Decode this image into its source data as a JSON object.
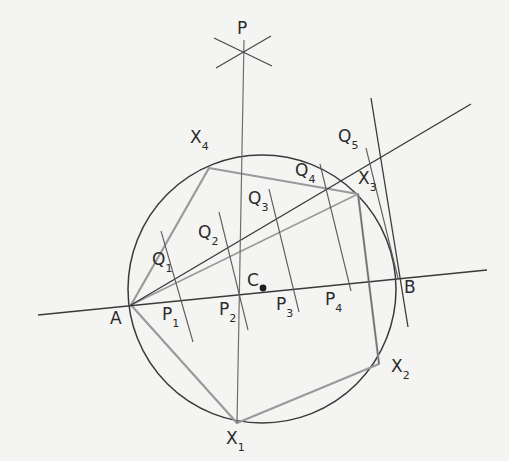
{
  "figure": {
    "background_color": "#f4f4f2",
    "ink_color": "#3a3a3a",
    "accent_color": "#8c8c8c",
    "width": 509,
    "height": 461
  },
  "circle": {
    "center_x": 262,
    "center_y": 289,
    "radius": 134,
    "stroke": "#3a3a3a"
  },
  "center_dot": {
    "x": 263,
    "y": 288,
    "label": "C"
  },
  "points": {
    "P": {
      "label": "P",
      "sub": "",
      "x": 242,
      "y": 49,
      "label_x": 237,
      "label_y": 20
    },
    "A": {
      "label": "A",
      "sub": "",
      "x": 131,
      "y": 305,
      "label_x": 110,
      "label_y": 310
    },
    "B": {
      "label": "B",
      "sub": "",
      "x": 397,
      "y": 278,
      "label_x": 404,
      "label_y": 279
    },
    "C": {
      "label": "C",
      "sub": "",
      "x": 263,
      "y": 288,
      "label_x": 247,
      "label_y": 272
    },
    "X1": {
      "label": "X",
      "sub": "1",
      "x": 237,
      "y": 423,
      "label_x": 226,
      "label_y": 430
    },
    "X2": {
      "label": "X",
      "sub": "2",
      "x": 379,
      "y": 364,
      "label_x": 391,
      "label_y": 358
    },
    "X3": {
      "label": "X",
      "sub": "3",
      "x": 358,
      "y": 194,
      "label_x": 358,
      "label_y": 170
    },
    "X4": {
      "label": "X",
      "sub": "4",
      "x": 209,
      "y": 168,
      "label_x": 190,
      "label_y": 129
    },
    "P1": {
      "label": "P",
      "sub": "1",
      "x": 180,
      "y": 302,
      "label_x": 162,
      "label_y": 306
    },
    "P2": {
      "label": "P",
      "sub": "2",
      "x": 238,
      "y": 296,
      "label_x": 219,
      "label_y": 301
    },
    "P3": {
      "label": "P",
      "sub": "3",
      "x": 292,
      "y": 290,
      "label_x": 276,
      "label_y": 296
    },
    "P4": {
      "label": "P",
      "sub": "4",
      "x": 341,
      "y": 285,
      "label_x": 325,
      "label_y": 291
    },
    "Q1": {
      "label": "Q",
      "sub": "1",
      "x": 180,
      "y": 258,
      "label_x": 152,
      "label_y": 251
    },
    "Q2": {
      "label": "Q",
      "sub": "2",
      "x": 226,
      "y": 235,
      "label_x": 198,
      "label_y": 224
    },
    "Q3": {
      "label": "Q",
      "sub": "3",
      "x": 276,
      "y": 214,
      "label_x": 248,
      "label_y": 190
    },
    "Q4": {
      "label": "Q",
      "sub": "4",
      "x": 330,
      "y": 186,
      "label_x": 295,
      "label_y": 162
    },
    "Q5": {
      "label": "Q",
      "sub": "5",
      "x": 372,
      "y": 158,
      "label_x": 338,
      "label_y": 128
    }
  },
  "polygon": {
    "name": "inscribed-polygon",
    "stroke": "#9a9a9a",
    "vertices": [
      "A",
      "X4",
      "X3",
      "X2",
      "X1"
    ],
    "path": "M131,305 L209,168 L358,194 L379,364 L237,423 Z"
  },
  "lines": {
    "chord_AB": {
      "name": "line-AB",
      "x1": 38,
      "y1": 315,
      "x2": 487,
      "y2": 270
    },
    "ray_A_Q5": {
      "name": "ray-A-to-Q5",
      "x1": 131,
      "y1": 305,
      "x2": 471,
      "y2": 104
    },
    "vertical_P": {
      "name": "line-P-X1",
      "x1": 244,
      "y1": 40,
      "x2": 237,
      "y2": 423
    },
    "tangent_B": {
      "name": "tangent-at-B",
      "x1": 371,
      "y1": 98,
      "x2": 408,
      "y2": 327
    },
    "perp_1": {
      "name": "perpendicular-P1-Q1",
      "x1": 161,
      "y1": 231,
      "x2": 193,
      "y2": 342
    },
    "perp_2": {
      "name": "perpendicular-P2-Q2",
      "x1": 219,
      "y1": 212,
      "x2": 248,
      "y2": 330
    },
    "perp_3": {
      "name": "perpendicular-P3-Q3",
      "x1": 269,
      "y1": 189,
      "x2": 299,
      "y2": 312
    },
    "perp_4": {
      "name": "perpendicular-P4-Q4",
      "x1": 320,
      "y1": 164,
      "x2": 351,
      "y2": 291
    },
    "perp_5": {
      "name": "perpendicular-B-Q5",
      "x1": 366,
      "y1": 148,
      "x2": 398,
      "y2": 278
    },
    "seg_X3_X2": {
      "name": "segment-X3-X2",
      "x1": 358,
      "y1": 194,
      "x2": 379,
      "y2": 364
    }
  },
  "cross_mark": {
    "name": "arc-intersection-cross",
    "center_x": 243,
    "center_y": 52,
    "arm1": "M214,38 L272,66",
    "arm2": "M216,68 L271,36"
  }
}
